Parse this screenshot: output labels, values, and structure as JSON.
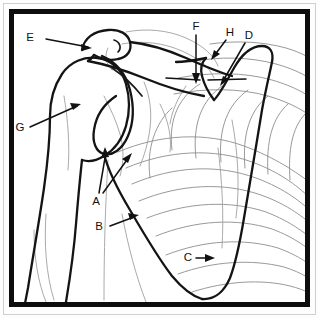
{
  "figure": {
    "kind": "anatomical-line-drawing",
    "frame_color": "#0d0d0d",
    "bone_line_color": "#141414",
    "soft_tissue_line_color": "#9b9b9b",
    "background_color": "#ffffff"
  },
  "labels": [
    {
      "id": "E",
      "text": "E",
      "x": 36,
      "y": 38,
      "arrow_to_x": 92,
      "arrow_to_y": 48,
      "note": "upper clavicle / acromion region"
    },
    {
      "id": "G",
      "text": "G",
      "x": 20,
      "y": 128,
      "arrow_to_x": 81,
      "arrow_to_y": 104,
      "note": "humeral head body"
    },
    {
      "id": "A",
      "text": "A",
      "x": 96,
      "y": 201,
      "arrow_to_x": 106,
      "arrow_to_y": 148,
      "note": "glenoid rim, two leaders"
    },
    {
      "id": "B",
      "text": "B",
      "x": 99,
      "y": 228,
      "arrow_to_x": 139,
      "arrow_to_y": 216,
      "note": "lateral scapular border"
    },
    {
      "id": "C",
      "text": "C",
      "x": 188,
      "y": 258,
      "arrow_to_x": 215,
      "arrow_to_y": 258,
      "note": "inferior scapular angle"
    },
    {
      "id": "F",
      "text": "F",
      "x": 196,
      "y": 27,
      "arrow_to_x": 196,
      "arrow_to_y": 83,
      "note": "vertical downward leader"
    },
    {
      "id": "H",
      "text": "H",
      "x": 229,
      "y": 33,
      "arrow_to_x": 212,
      "arrow_to_y": 60,
      "note": "superior scapular notch"
    },
    {
      "id": "D",
      "text": "D",
      "x": 248,
      "y": 36,
      "arrow_to_x": 221,
      "arrow_to_y": 86,
      "note": "coracoid / medial border"
    }
  ],
  "label_letters": {
    "a": "A",
    "b": "B",
    "c": "C",
    "d": "D",
    "e": "E",
    "f": "F",
    "g": "G",
    "h": "H"
  }
}
